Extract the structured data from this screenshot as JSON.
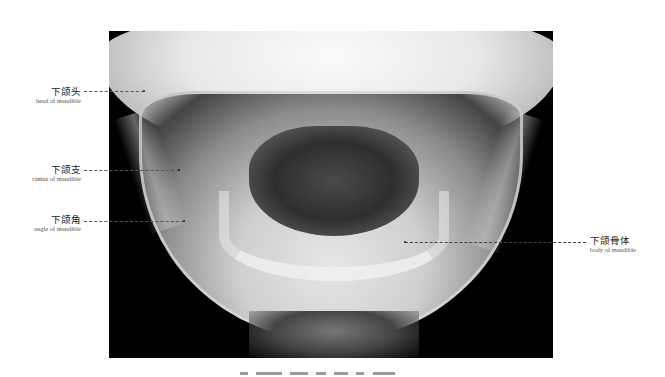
{
  "figure": {
    "type": "radiograph",
    "background": "#ffffff",
    "image_background": "#000000"
  },
  "labels": [
    {
      "id": "head",
      "zh": "下颌头",
      "en": "head of mandible",
      "side": "left"
    },
    {
      "id": "ramus",
      "zh": "下颌支",
      "en": "ramus of mandible",
      "side": "left"
    },
    {
      "id": "angle",
      "zh": "下颌角",
      "en": "angle of mandible",
      "side": "left"
    },
    {
      "id": "body",
      "zh": "下颌骨体",
      "en": "body of mandible",
      "side": "right"
    }
  ],
  "caption": {
    "visible": "clipped"
  }
}
